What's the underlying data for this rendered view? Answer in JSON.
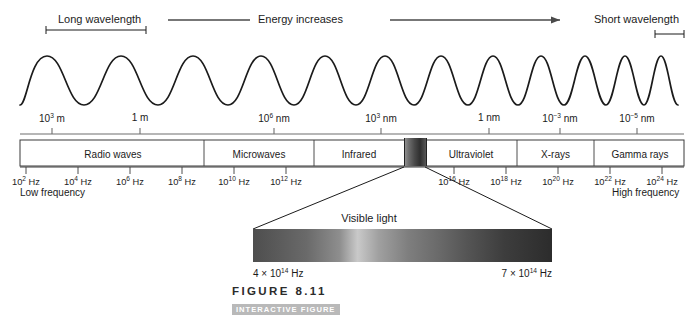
{
  "figure": {
    "number": "FIGURE 8.11",
    "interactive_badge": "INTERACTIVE FIGURE",
    "logo": "MP"
  },
  "annotations": {
    "long_wavelength": "Long wavelength",
    "short_wavelength": "Short wavelength",
    "energy_increases": "Energy increases",
    "low_frequency": "Low frequency",
    "high_frequency": "High frequency",
    "visible_light": "Visible light"
  },
  "chart_data": {
    "type": "diagram",
    "wave": {
      "description": "Sinusoidal wave compressing from long to short wavelength left to right",
      "long_period_px": 75,
      "short_period_px": 22
    },
    "wavelength_axis": {
      "label": "Wavelength",
      "ticks": [
        {
          "x": 52,
          "base": "10",
          "exp": "3",
          "unit": " m"
        },
        {
          "x": 140,
          "base": "1",
          "exp": "",
          "unit": " m"
        },
        {
          "x": 274,
          "base": "10",
          "exp": "6",
          "unit": " nm"
        },
        {
          "x": 381,
          "base": "10",
          "exp": "3",
          "unit": " nm"
        },
        {
          "x": 489,
          "base": "1",
          "exp": "",
          "unit": " nm"
        },
        {
          "x": 560,
          "base": "10",
          "exp": "-3",
          "unit": " nm"
        },
        {
          "x": 637,
          "base": "10",
          "exp": "-5",
          "unit": " nm"
        }
      ]
    },
    "frequency_axis": {
      "label": "Frequency",
      "ticks": [
        {
          "x": 26,
          "base": "10",
          "exp": "2",
          "unit": " Hz"
        },
        {
          "x": 78,
          "base": "10",
          "exp": "4",
          "unit": " Hz"
        },
        {
          "x": 130,
          "base": "10",
          "exp": "6",
          "unit": " Hz"
        },
        {
          "x": 182,
          "base": "10",
          "exp": "8",
          "unit": " Hz"
        },
        {
          "x": 234,
          "base": "10",
          "exp": "10",
          "unit": " Hz"
        },
        {
          "x": 286,
          "base": "10",
          "exp": "12",
          "unit": " Hz"
        },
        {
          "x": 338,
          "base": "10",
          "exp": "14",
          "unit": " Hz",
          "hidden": true
        },
        {
          "x": 454,
          "base": "10",
          "exp": "16",
          "unit": " Hz"
        },
        {
          "x": 506,
          "base": "10",
          "exp": "18",
          "unit": " Hz"
        },
        {
          "x": 558,
          "base": "10",
          "exp": "20",
          "unit": " Hz"
        },
        {
          "x": 610,
          "base": "10",
          "exp": "22",
          "unit": " Hz"
        },
        {
          "x": 662,
          "base": "10",
          "exp": "24",
          "unit": " Hz"
        }
      ]
    },
    "bands": [
      {
        "name": "Radio waves",
        "left": 22,
        "width": 182
      },
      {
        "name": "Microwaves",
        "left": 204,
        "width": 110
      },
      {
        "name": "Infrared",
        "left": 314,
        "width": 90
      },
      {
        "name": "Ultraviolet",
        "left": 425,
        "width": 92
      },
      {
        "name": "X-rays",
        "left": 517,
        "width": 77
      },
      {
        "name": "Gamma rays",
        "left": 594,
        "width": 92
      }
    ],
    "visible_light_callout": {
      "label": "Visible light",
      "left_frequency": {
        "coefficient": "4",
        "base": "10",
        "exp": "14",
        "unit": " Hz"
      },
      "right_frequency": {
        "coefficient": "7",
        "base": "10",
        "exp": "14",
        "unit": " Hz"
      },
      "source_left_px": 404,
      "source_right_px": 425,
      "bar_left_px": 253,
      "bar_right_px": 552
    }
  }
}
